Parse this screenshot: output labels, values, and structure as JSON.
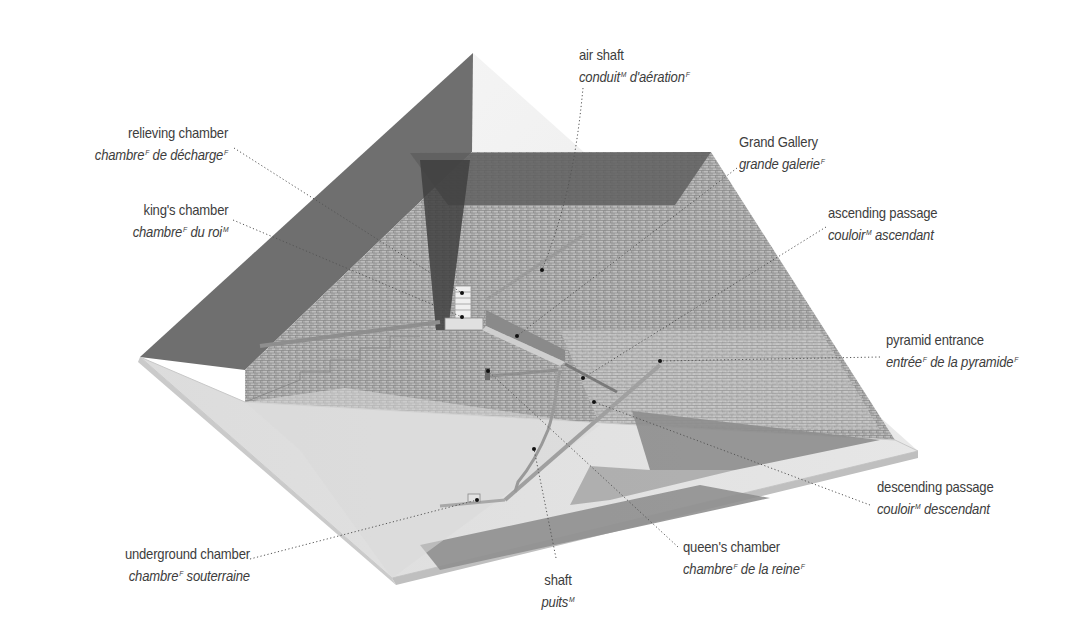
{
  "diagram": {
    "colors": {
      "outer_face_dark": "#6e6e6e",
      "outer_face_light": "#eeeeee",
      "cut_plane": "#c9c9c9",
      "base": "#d4d4d4",
      "channel_dark": "#8a8a8a",
      "text": "#3d3d3d",
      "leader": "#555555"
    }
  },
  "labels": [
    {
      "id": "air-shaft",
      "en": "air shaft",
      "fr_parts": [
        {
          "t": "conduit",
          "g": "M"
        },
        {
          "t": " d'aération",
          "g": "F"
        }
      ]
    },
    {
      "id": "relieving-chamber",
      "en": "relieving chamber",
      "fr_parts": [
        {
          "t": "chambre",
          "g": "F"
        },
        {
          "t": " de décharge",
          "g": "F"
        }
      ]
    },
    {
      "id": "grand-gallery",
      "en": "Grand Gallery",
      "fr_parts": [
        {
          "t": "grande galerie",
          "g": "F"
        }
      ]
    },
    {
      "id": "kings-chamber",
      "en": "king's chamber",
      "fr_parts": [
        {
          "t": "chambre",
          "g": "F"
        },
        {
          "t": " du roi",
          "g": "M"
        }
      ]
    },
    {
      "id": "ascending-passage",
      "en": "ascending passage",
      "fr_parts": [
        {
          "t": "couloir",
          "g": "M"
        },
        {
          "t": " ascendant",
          "g": ""
        }
      ]
    },
    {
      "id": "pyramid-entrance",
      "en": "pyramid entrance",
      "fr_parts": [
        {
          "t": "entrée",
          "g": "F"
        },
        {
          "t": " de la pyramide",
          "g": "F"
        }
      ]
    },
    {
      "id": "descending-passage",
      "en": "descending passage",
      "fr_parts": [
        {
          "t": "couloir",
          "g": "M"
        },
        {
          "t": " descendant",
          "g": ""
        }
      ]
    },
    {
      "id": "underground-chamber",
      "en": "underground chamber",
      "fr_parts": [
        {
          "t": "chambre",
          "g": "F"
        },
        {
          "t": " souterraine",
          "g": ""
        }
      ]
    },
    {
      "id": "shaft",
      "en": "shaft",
      "fr_parts": [
        {
          "t": "puits",
          "g": "M"
        }
      ]
    },
    {
      "id": "queens-chamber",
      "en": "queen's chamber",
      "fr_parts": [
        {
          "t": "chambre",
          "g": "F"
        },
        {
          "t": " de la reine",
          "g": "F"
        }
      ]
    }
  ]
}
